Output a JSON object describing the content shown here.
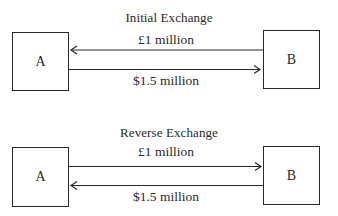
{
  "diagrams": [
    {
      "title": "Initial Exchange",
      "party_left": "A",
      "party_right": "B",
      "upper_flow": {
        "label": "£1 million",
        "direction": "B-to-A"
      },
      "lower_flow": {
        "label": "$1.5 million",
        "direction": "A-to-B"
      }
    },
    {
      "title": "Reverse Exchange",
      "party_left": "A",
      "party_right": "B",
      "upper_flow": {
        "label": "£1 million",
        "direction": "A-to-B"
      },
      "lower_flow": {
        "label": "$1.5 million",
        "direction": "B-to-A"
      }
    }
  ],
  "colors": {
    "stroke": "#2a2a2a",
    "background": "#ffffff"
  }
}
